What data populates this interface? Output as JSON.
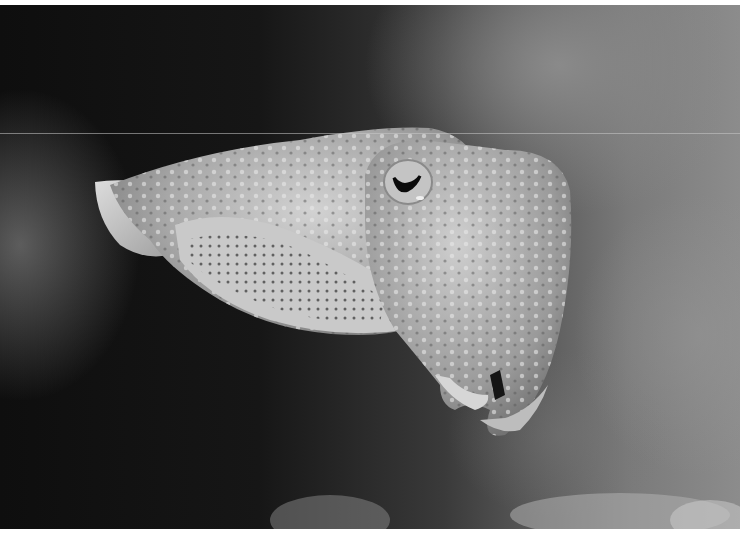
{
  "image": {
    "subject": "cuttlefish",
    "description": "Grayscale photograph of a cuttlefish swimming right against a dark underwater rocky background",
    "colors": {
      "background_dark": "#111111",
      "background_light": "#8a8a8a",
      "body": "#b8b8b8",
      "highlight": "#e6e6e6",
      "border": "#ffffff"
    }
  }
}
